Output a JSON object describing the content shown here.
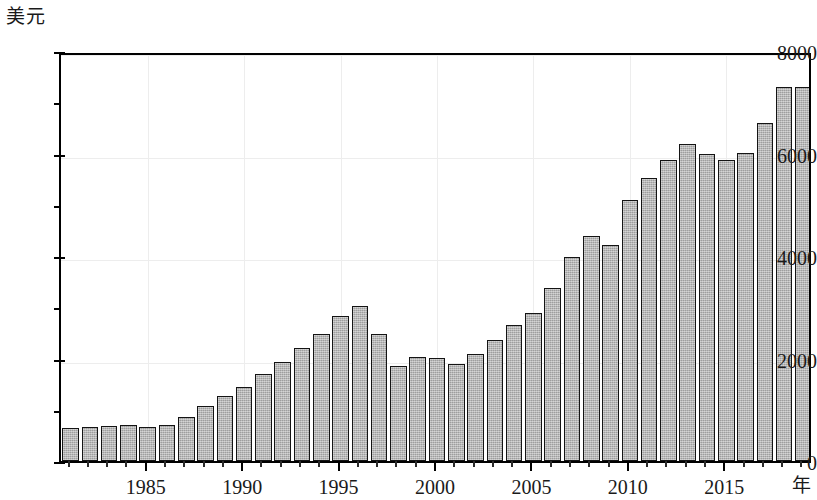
{
  "chart_data": {
    "type": "bar",
    "title": "",
    "ylabel": "美元",
    "xlabel": "年",
    "ylim": [
      0,
      8000
    ],
    "ytick_labels": [
      "0",
      "2000",
      "4000",
      "6000",
      "8000"
    ],
    "ytick_values": [
      0,
      2000,
      4000,
      6000,
      8000
    ],
    "yminor_values": [
      1000,
      3000,
      5000,
      7000
    ],
    "xtick_labels": [
      "1985",
      "1990",
      "1995",
      "2000",
      "2005",
      "2010",
      "2015"
    ],
    "xtick_values": [
      1985,
      1990,
      1995,
      2000,
      2005,
      2010,
      2015
    ],
    "xlim": [
      1980.5,
      2019.5
    ],
    "grid": true,
    "legend": "none",
    "bar_fill_color": "#b0b0b0",
    "bar_edge_color": "#141414",
    "categories": [
      1981,
      1982,
      1983,
      1984,
      1985,
      1986,
      1987,
      1988,
      1989,
      1990,
      1991,
      1992,
      1993,
      1994,
      1995,
      1996,
      1997,
      1998,
      1999,
      2000,
      2001,
      2002,
      2003,
      2004,
      2005,
      2006,
      2007,
      2008,
      2009,
      2010,
      2011,
      2012,
      2013,
      2014,
      2015,
      2016,
      2017,
      2018,
      2019
    ],
    "values": [
      640,
      660,
      680,
      700,
      660,
      700,
      860,
      1080,
      1260,
      1440,
      1690,
      1930,
      2210,
      2480,
      2830,
      3030,
      2470,
      1850,
      2020,
      2010,
      1890,
      2080,
      2370,
      2650,
      2890,
      3370,
      3990,
      4400,
      4210,
      5100,
      5520,
      5880,
      6190,
      5990,
      5880,
      6010,
      6600,
      7290,
      7290
    ]
  }
}
